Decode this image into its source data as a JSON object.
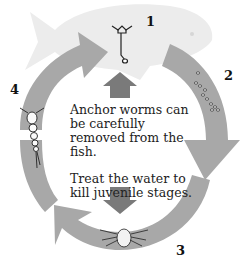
{
  "diagram": {
    "center_text": {
      "line1": "Anchor worms can be carefully removed from the fish.",
      "line2": "Treat the water to kill juvenile stages."
    },
    "stages": [
      {
        "number": "1",
        "description": "Adult anchor worm attached to fish"
      },
      {
        "number": "2",
        "description": "Eggs"
      },
      {
        "number": "3",
        "description": "Nauplius larva"
      },
      {
        "number": "4",
        "description": "Copepodid juvenile"
      }
    ],
    "colors": {
      "cycle_arrow": "#a8a8a8",
      "center_arrow": "#7a7a7a",
      "fish": "#ececec",
      "text": "#222222"
    }
  }
}
